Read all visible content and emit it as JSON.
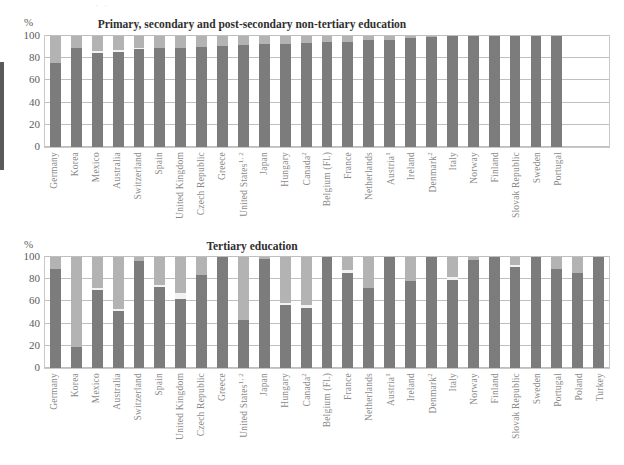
{
  "top_crop_ghost": "·      ·",
  "axis": {
    "unit_label": "%",
    "yticks": [
      0,
      20,
      40,
      60,
      80,
      100
    ],
    "ymin": 0,
    "ymax": 100
  },
  "colors": {
    "public": "#7c7c7c",
    "private": "#b3b3b3",
    "mid": "#f2f2f2",
    "grid": "#bfbfbf",
    "frame": "#c9c9c9",
    "label": "#8a8a8a",
    "title": "#2f2f2f"
  },
  "chart_data": [
    {
      "type": "bar",
      "id": "primary-secondary-chart",
      "title": "Primary, secondary and post-secondary non-tertiary education",
      "xlabel": "",
      "ylabel": "%",
      "ylim": [
        0,
        100
      ],
      "grid": true,
      "stacked": true,
      "legend": "none",
      "empty_slots_at_end": 2,
      "categories": [
        "Germany",
        "Korea",
        "Mexico",
        "Australia",
        "Switzerland",
        "Spain",
        "United Kingdom",
        "Czech Republic",
        "Greece",
        "United States",
        "Japan",
        "Hungary",
        "Canada",
        "Belgium (Fl.)",
        "France",
        "Netherlands",
        "Austria",
        "Ireland",
        "Denmark",
        "Italy",
        "Norway",
        "Finland",
        "Slovak Republic",
        "Sweden",
        "Portugal"
      ],
      "category_footnotes": {
        "United States": "1, 2",
        "Canada": "2",
        "Austria": "1",
        "Denmark": "2"
      },
      "series": [
        {
          "name": "Public",
          "values": [
            76,
            89,
            85,
            86,
            88,
            89,
            89,
            90,
            91,
            92,
            93,
            93,
            94,
            95,
            95,
            96,
            96,
            98,
            99,
            100,
            100,
            100,
            100,
            100,
            100
          ]
        },
        {
          "name": "Mid",
          "values": [
            0,
            0,
            1.5,
            1.5,
            1.5,
            0,
            0,
            0,
            0,
            0,
            0,
            0,
            0,
            0,
            0,
            0,
            0,
            0,
            0,
            0,
            0,
            0,
            0,
            0,
            0
          ]
        },
        {
          "name": "Private",
          "values": [
            24,
            11,
            13.5,
            12.5,
            10.5,
            11,
            11,
            10,
            9,
            8,
            7,
            7,
            6,
            5,
            5,
            4,
            4,
            2,
            1,
            0,
            0,
            0,
            0,
            0,
            0
          ]
        }
      ]
    },
    {
      "type": "bar",
      "id": "tertiary-chart",
      "title": "Tertiary education",
      "xlabel": "",
      "ylabel": "%",
      "ylim": [
        0,
        100
      ],
      "grid": true,
      "stacked": true,
      "legend": "none",
      "empty_slots_at_end": 0,
      "categories": [
        "Germany",
        "Korea",
        "Mexico",
        "Australia",
        "Switzerland",
        "Spain",
        "United Kingdom",
        "Czech Republic",
        "Greece",
        "United States",
        "Japan",
        "Hungary",
        "Canada",
        "Belgium (Fl.)",
        "France",
        "Netherlands",
        "Austria",
        "Ireland",
        "Denmark",
        "Italy",
        "Norway",
        "Finland",
        "Slovak Republic",
        "Sweden",
        "Portugal",
        "Poland",
        "Turkey"
      ],
      "category_footnotes": {
        "United States": "1, 2",
        "Canada": "2",
        "Austria": "1",
        "Denmark": "2"
      },
      "series": [
        {
          "name": "Public",
          "values": [
            89,
            19,
            70,
            51,
            96,
            73,
            62,
            84,
            100,
            43,
            98,
            57,
            54,
            100,
            86,
            72,
            100,
            78,
            100,
            79,
            97,
            100,
            91,
            100,
            89,
            86,
            100
          ]
        },
        {
          "name": "Mid",
          "values": [
            0,
            0,
            2.5,
            2,
            0,
            2,
            6,
            0,
            0,
            0,
            0,
            2,
            3,
            0,
            2,
            0,
            0,
            0,
            0,
            3,
            0,
            0,
            2,
            0,
            0,
            0,
            0
          ]
        },
        {
          "name": "Private",
          "values": [
            11,
            81,
            27.5,
            47,
            4,
            25,
            32,
            16,
            0,
            57,
            2,
            41,
            43,
            0,
            12,
            28,
            0,
            22,
            0,
            18,
            3,
            0,
            7,
            0,
            11,
            14,
            0
          ]
        }
      ]
    }
  ]
}
